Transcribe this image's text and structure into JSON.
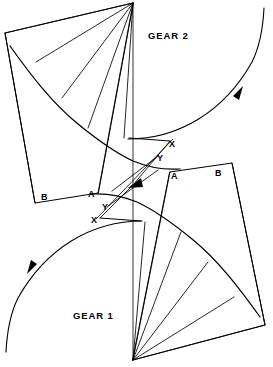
{
  "figure": {
    "type": "diagram",
    "background_color": "#ffffff",
    "line_color": "#000000",
    "width": 273,
    "height": 367
  },
  "labels": {
    "gear2": "GEAR 2",
    "gear1": "GEAR 1",
    "gear2_x": "X",
    "gear2_y": "Y",
    "gear2_a": "A",
    "gear2_b": "B",
    "gear1_x": "X",
    "gear1_y": "Y",
    "gear1_a": "A",
    "gear1_b": "B"
  },
  "label_positions": {
    "gear2": {
      "x": 148,
      "y": 36
    },
    "gear1": {
      "x": 73,
      "y": 316
    },
    "gear2_x": {
      "x": 169,
      "y": 146
    },
    "gear2_y": {
      "x": 157,
      "y": 160
    },
    "gear2_a_left": {
      "x": 88,
      "y": 197
    },
    "gear2_b_left": {
      "x": 41,
      "y": 200
    },
    "gear1_a_right": {
      "x": 171,
      "y": 179
    },
    "gear1_b_right": {
      "x": 215,
      "y": 176
    },
    "gear1_y": {
      "x": 102,
      "y": 209
    },
    "gear1_x": {
      "x": 91,
      "y": 222
    }
  },
  "geometry": {
    "pitch_point": {
      "x": 133,
      "y": 185
    },
    "gear2_center": {
      "x": 133,
      "y": 3
    },
    "gear1_center": {
      "x": 133,
      "y": 360
    },
    "center_line": {
      "x1": 133,
      "y1": 3,
      "x2": 133,
      "y2": 360
    },
    "gear2_fan_endpoints": [
      {
        "x": 5,
        "y": 33
      },
      {
        "x": 36,
        "y": 62
      },
      {
        "x": 62,
        "y": 98
      },
      {
        "x": 88,
        "y": 128
      },
      {
        "x": 124,
        "y": 138
      }
    ],
    "gear1_fan_endpoints": [
      {
        "x": 265,
        "y": 325
      },
      {
        "x": 234,
        "y": 297
      },
      {
        "x": 208,
        "y": 262
      },
      {
        "x": 181,
        "y": 232
      },
      {
        "x": 145,
        "y": 222
      }
    ],
    "gear2_tooth_tip": {
      "x1": 130,
      "y1": 138,
      "x2": 168,
      "y2": 140
    },
    "gear1_tooth_tip": {
      "x1": 140,
      "y1": 220,
      "x2": 102,
      "y2": 218
    },
    "gear2_outer_quad": [
      {
        "x": 5,
        "y": 33
      },
      {
        "x": 35,
        "y": 203
      },
      {
        "x": 98,
        "y": 193
      },
      {
        "x": 133,
        "y": 3
      }
    ],
    "gear1_outer_quad": [
      {
        "x": 265,
        "y": 325
      },
      {
        "x": 232,
        "y": 163
      },
      {
        "x": 170,
        "y": 172
      },
      {
        "x": 133,
        "y": 360
      }
    ],
    "gear2_involute": [
      {
        "x": 10,
        "y": 46
      },
      {
        "x": 40,
        "y": 80
      },
      {
        "x": 72,
        "y": 116
      },
      {
        "x": 104,
        "y": 145
      },
      {
        "x": 133,
        "y": 160
      },
      {
        "x": 160,
        "y": 168
      },
      {
        "x": 180,
        "y": 169
      }
    ],
    "gear1_involute": [
      {
        "x": 262,
        "y": 318
      },
      {
        "x": 231,
        "y": 284
      },
      {
        "x": 199,
        "y": 248
      },
      {
        "x": 167,
        "y": 219
      },
      {
        "x": 138,
        "y": 204
      },
      {
        "x": 111,
        "y": 196
      },
      {
        "x": 91,
        "y": 195
      }
    ],
    "gear2_pitch_arc": {
      "start": {
        "x": 128,
        "y": 139
      },
      "end": {
        "x": 262,
        "y": 10
      }
    },
    "gear1_pitch_arc": {
      "start": {
        "x": 141,
        "y": 221
      },
      "end": {
        "x": 11,
        "y": 350
      }
    },
    "arrow_gear2": {
      "x": 238,
      "y": 92,
      "direction": "clockwise-down-right"
    },
    "arrow_gear1": {
      "x": 30,
      "y": 272,
      "direction": "clockwise-down-left"
    },
    "arrow_pitch": {
      "x": 137,
      "y": 183,
      "direction": "toward-pitch-point"
    }
  },
  "style": {
    "stroke_width_main": 0.9,
    "stroke_width_thin": 0.7,
    "stroke_width_curve": 1.15
  }
}
